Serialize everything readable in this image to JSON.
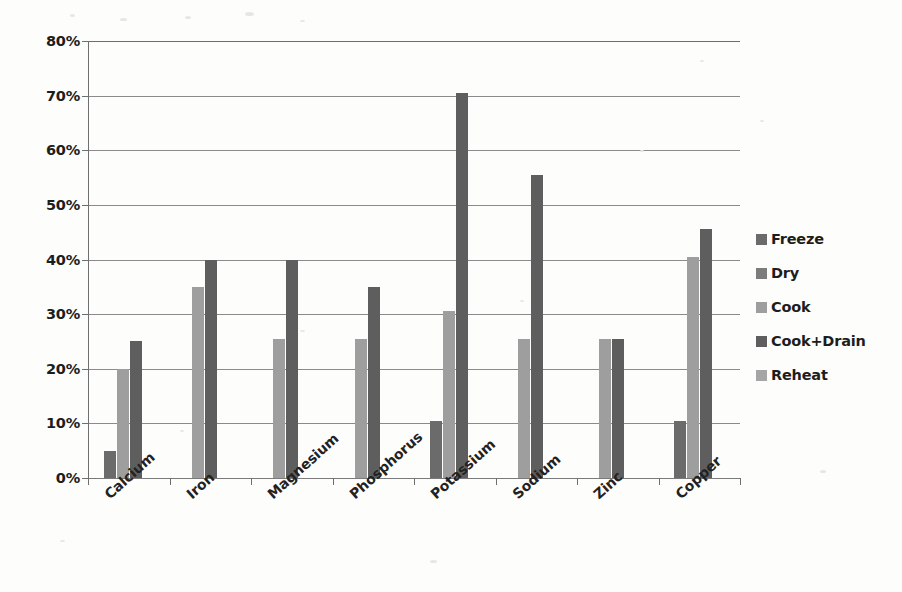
{
  "chart_data": {
    "type": "bar",
    "title": "",
    "subtitle": "",
    "xlabel": "",
    "ylabel": "",
    "ylim": [
      0,
      80
    ],
    "ytick_labels": [
      "0%",
      "10%",
      "20%",
      "30%",
      "40%",
      "50%",
      "60%",
      "70%",
      "80%"
    ],
    "ytick_values": [
      0,
      10,
      20,
      30,
      40,
      50,
      60,
      70,
      80
    ],
    "grid": true,
    "legend_position": "right",
    "value_unit": "%",
    "categories": [
      "Calcium",
      "Iron",
      "Magnesium",
      "Phosphorus",
      "Potassium",
      "Sodium",
      "Zinc",
      "Copper"
    ],
    "series": [
      {
        "name": "Freeze",
        "color": "#6b6b6b",
        "values": [
          5,
          0,
          0,
          0,
          10.5,
          0,
          0,
          10.5
        ]
      },
      {
        "name": "Dry",
        "color": "#7c7c7c",
        "values": [
          0,
          0,
          0,
          0,
          0,
          0,
          0,
          0
        ]
      },
      {
        "name": "Cook",
        "color": "#9e9e9e",
        "values": [
          20,
          35,
          25.5,
          25.5,
          30.5,
          25.5,
          25.5,
          40.5
        ]
      },
      {
        "name": "Cook+Drain",
        "color": "#5e5e5e",
        "values": [
          25,
          40,
          40,
          35,
          70.5,
          55.5,
          25.5,
          45.5
        ]
      },
      {
        "name": "Reheat",
        "color": "#a5a5a5",
        "values": [
          0,
          0,
          0,
          0,
          0,
          0,
          0,
          0
        ]
      }
    ]
  },
  "legend": {
    "items": [
      {
        "label": "Freeze"
      },
      {
        "label": "Dry"
      },
      {
        "label": "Cook"
      },
      {
        "label": "Cook+Drain"
      },
      {
        "label": "Reheat"
      }
    ]
  },
  "colors": {
    "background": "#fdfdfb",
    "gridline": "#8b8b8b",
    "axis": "#6f6f6f",
    "text": "#1d1d1d"
  }
}
